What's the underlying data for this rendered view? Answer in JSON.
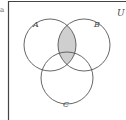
{
  "diagram": {
    "type": "venn",
    "corner_marker": "a",
    "universe_label": "U",
    "sets": [
      {
        "name": "A",
        "label": "A",
        "cx": 50,
        "cy": 45,
        "r": 26
      },
      {
        "name": "B",
        "label": "B",
        "cx": 84,
        "cy": 45,
        "r": 26
      },
      {
        "name": "C",
        "label": "C",
        "cx": 67,
        "cy": 78,
        "r": 26
      }
    ],
    "shaded_region": "A ∩ B",
    "colors": {
      "stroke": "#555555",
      "frame": "#444444",
      "shade": "#cfcfcf"
    }
  }
}
